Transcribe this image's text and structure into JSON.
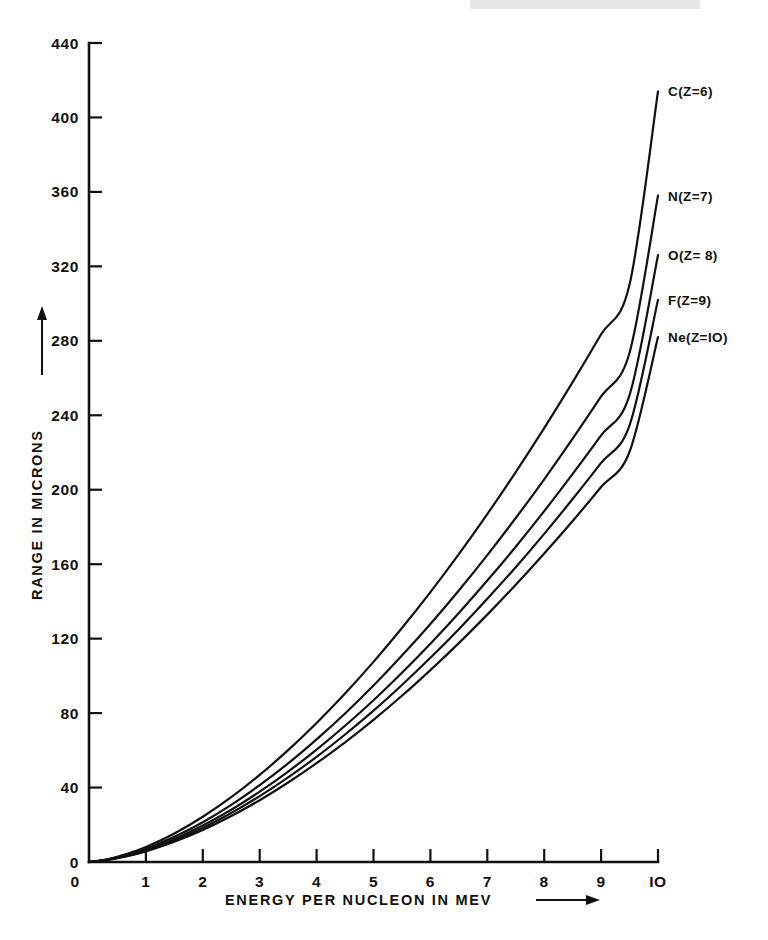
{
  "figure": {
    "background_color": "#ffffff",
    "ink_color": "#111111"
  },
  "chart_data": {
    "type": "line",
    "title": "",
    "xlabel": "ENERGY PER NUCLEON IN MEV",
    "ylabel": "RANGE IN MICRONS",
    "xlabel_arrow": "⟶",
    "ylabel_arrow": "⟶",
    "xlim": [
      0,
      10
    ],
    "ylim": [
      0,
      440
    ],
    "grid": false,
    "legend_position": "right-inline-end-of-curve",
    "xticks": [
      0,
      1,
      2,
      3,
      4,
      5,
      6,
      7,
      8,
      9,
      10
    ],
    "xtick_labels": [
      "0",
      "1",
      "2",
      "3",
      "4",
      "5",
      "6",
      "7",
      "8",
      "9",
      "IO"
    ],
    "yticks": [
      0,
      40,
      80,
      120,
      160,
      200,
      240,
      280,
      320,
      360,
      400,
      440
    ],
    "ytick_labels": [
      "0",
      "40",
      "80",
      "120",
      "160",
      "200",
      "240",
      "280",
      "320",
      "360",
      "400",
      "440"
    ],
    "x": [
      0,
      0.25,
      0.5,
      0.75,
      1,
      1.5,
      2,
      2.5,
      3,
      3.5,
      4,
      4.5,
      5,
      5.5,
      6,
      6.5,
      7,
      7.5,
      8,
      8.5,
      9,
      9.5,
      10
    ],
    "series": [
      {
        "name": "C(Z=6)",
        "element": "C",
        "Z": 6,
        "label": "C(Z=6)",
        "end_value": 414,
        "values": [
          0,
          1.0,
          2.8,
          5.2,
          8.0,
          15.3,
          24.3,
          34.8,
          46.8,
          60.1,
          74.7,
          90.5,
          107.5,
          125.7,
          145.0,
          165.4,
          186.9,
          209.5,
          233.1,
          257.8,
          283.5,
          310.2,
          414
        ]
      },
      {
        "name": "N(Z=7)",
        "element": "N",
        "Z": 7,
        "label": "N(Z=7)",
        "end_value": 358,
        "values": [
          0,
          0.9,
          2.5,
          4.6,
          7.1,
          13.5,
          21.4,
          30.7,
          41.3,
          53.0,
          65.9,
          79.8,
          94.8,
          110.9,
          127.9,
          145.9,
          164.9,
          184.8,
          205.6,
          227.4,
          250.1,
          273.6,
          358
        ]
      },
      {
        "name": "O(Z= 8)",
        "element": "O",
        "Z": 8,
        "label": "O(Z= 8)",
        "end_value": 326,
        "values": [
          0,
          0.85,
          2.3,
          4.2,
          6.5,
          12.4,
          19.6,
          28.1,
          37.8,
          48.6,
          60.4,
          73.2,
          86.9,
          101.7,
          117.3,
          133.8,
          151.2,
          169.4,
          188.5,
          208.5,
          229.2,
          250.8,
          326
        ]
      },
      {
        "name": "F(Z=9)",
        "element": "F",
        "Z": 9,
        "label": "F(Z=9)",
        "end_value": 302,
        "values": [
          0,
          0.8,
          2.2,
          3.9,
          6.1,
          11.6,
          18.3,
          26.3,
          35.4,
          45.5,
          56.5,
          68.5,
          81.3,
          95.1,
          109.7,
          125.1,
          141.4,
          158.4,
          176.3,
          195.0,
          214.4,
          234.6,
          302
        ]
      },
      {
        "name": "Ne(Z=IO)",
        "element": "Ne",
        "Z": 10,
        "label": "Ne(Z=IO)",
        "end_value": 282,
        "values": [
          0,
          0.75,
          2.0,
          3.7,
          5.7,
          10.9,
          17.2,
          24.7,
          33.2,
          42.7,
          53.1,
          64.3,
          76.4,
          89.3,
          103.1,
          117.6,
          132.9,
          148.9,
          165.7,
          183.2,
          201.5,
          220.4,
          282
        ]
      }
    ]
  },
  "labels": {
    "y_axis_text": "RANGE IN MICRONS",
    "x_axis_text": "ENERGY PER NUCLEON IN MEV"
  }
}
